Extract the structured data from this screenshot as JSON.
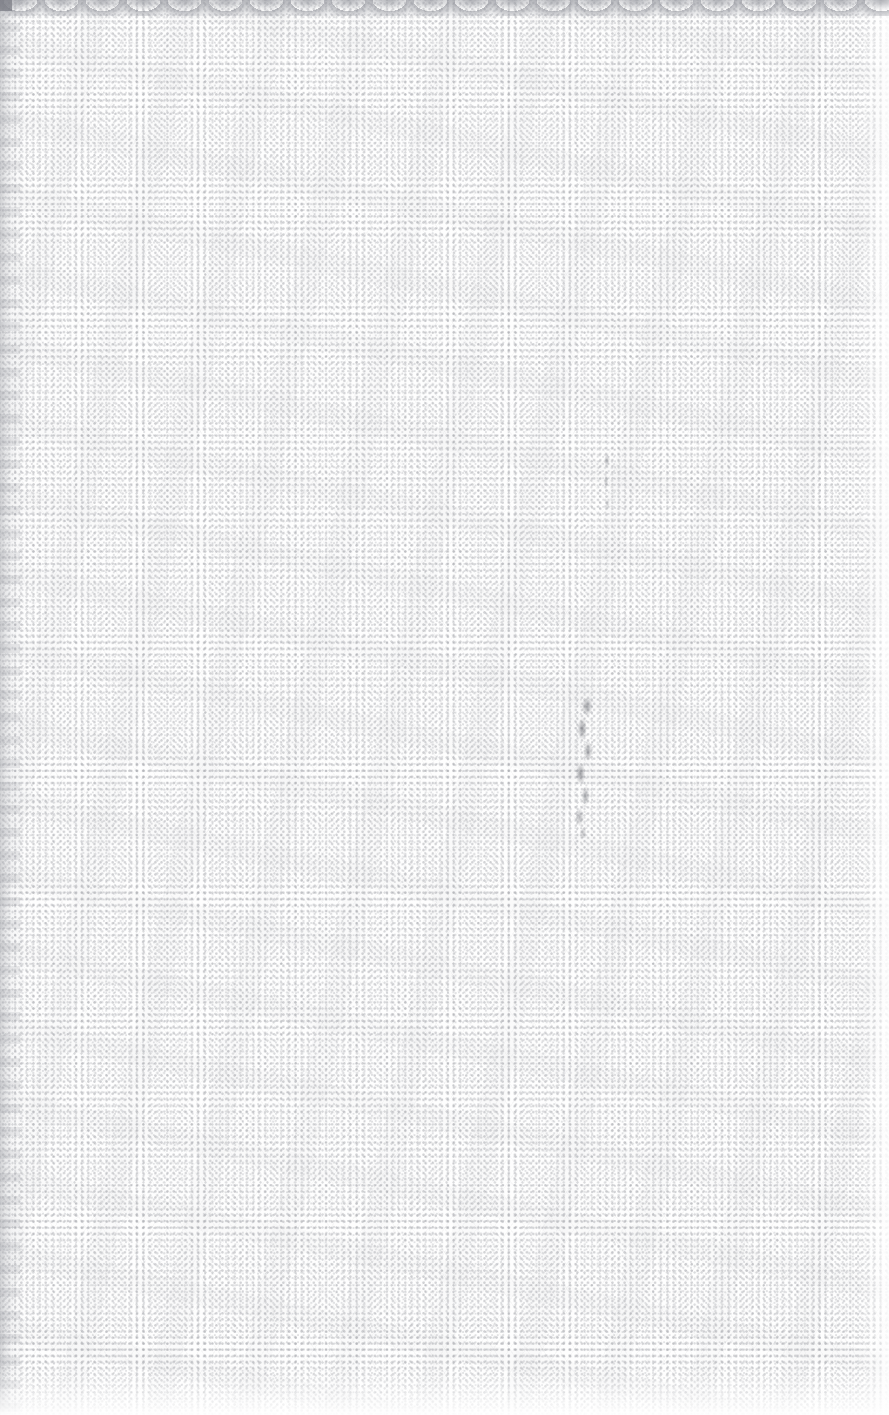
{
  "document": {
    "kind": "scanned-page",
    "page_state": "blank",
    "visible_text": "",
    "notes": "No printed text, headings, figures, tables or UI chrome are rendered anywhere on this page."
  },
  "canvas": {
    "width_px": 889,
    "height_px": 1415
  },
  "paper": {
    "base_color": "#fdfdfd",
    "texture": "halftone-moire",
    "texture_dot_color": "#787a82",
    "texture_dot_pitch_px": 6,
    "texture_lattice": "diagonal-diamond"
  },
  "artifacts": {
    "top_edge": {
      "label": "scalloped-scan-edge",
      "color": "#8a8c94",
      "height_px": 16,
      "scallop_period_px": 41
    },
    "left_edge": {
      "label": "gutter-shadow",
      "color": "#9698a0",
      "width_px": 26
    },
    "right_edge": {
      "label": "fade-to-white",
      "color": "#ffffff",
      "width_px": 30
    },
    "bottom_edge": {
      "label": "fade-to-white",
      "color": "#ffffff",
      "height_px": 46
    },
    "corner_block": {
      "label": "top-left-dark-block",
      "color": "#767880",
      "width_px": 12,
      "height_px": 11
    }
  },
  "marks": [
    {
      "id": "upper-smudge",
      "label": "faint-grey-smudge",
      "color": "#5c5e66",
      "x_px": 596,
      "y_px": 452,
      "width_px": 22,
      "height_px": 62
    },
    {
      "id": "lower-stroke",
      "label": "faint-vertical-pencil-stroke",
      "color": "#4e5058",
      "x_px": 562,
      "y_px": 698,
      "width_px": 42,
      "height_px": 140
    }
  ]
}
